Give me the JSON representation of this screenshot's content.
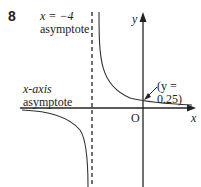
{
  "question_number": "8",
  "labels": {
    "vertical_asymptote_line1": "x = −4",
    "vertical_asymptote_line2": "asymptote",
    "horizontal_asymptote_line1": "x-axis",
    "horizontal_asymptote_line2": "asymptote",
    "y_intercept": "(y = 0.25)",
    "y_axis": "y",
    "x_axis": "x",
    "origin": "O"
  },
  "colors": {
    "ink": "#222222"
  }
}
